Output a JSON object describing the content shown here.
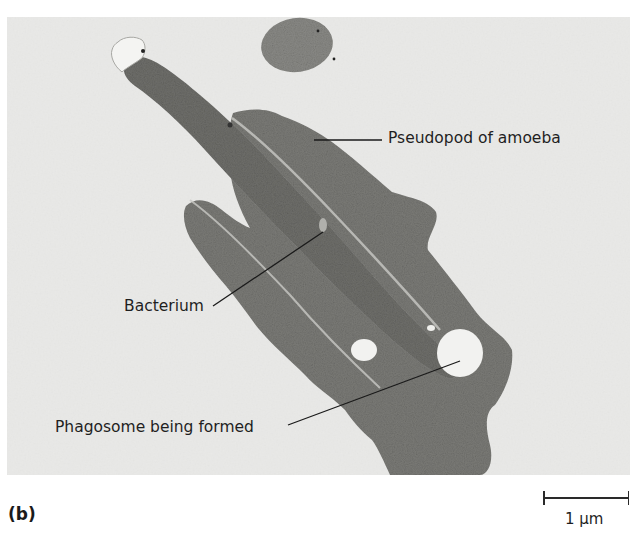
{
  "figure": {
    "panel_label": "(b)",
    "image_type": "transmission electron micrograph",
    "colors": {
      "background": "#e9e9e7",
      "cytoplasm": "#7a7a76",
      "bacterium": "#6e6e6a",
      "vacuole": "#f2f2f0",
      "label_text": "#1f1f1f"
    },
    "labels": {
      "pseudopod": "Pseudopod of amoeba",
      "bacterium": "Bacterium",
      "phagosome": "Phagosome being formed"
    },
    "scale_bar": {
      "value": "1 μm"
    }
  }
}
